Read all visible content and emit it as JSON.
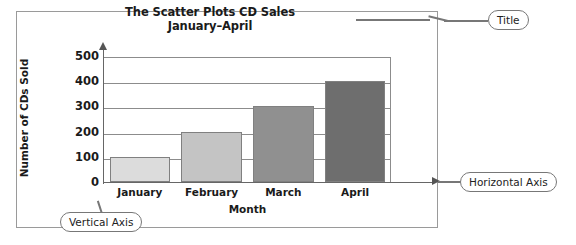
{
  "figure": {
    "frame_border_color": "#9a9a9a",
    "background": "#ffffff"
  },
  "chart_data": {
    "type": "bar",
    "title": "The Scatter Plots CD Sales",
    "subtitle": "January–April",
    "categories": [
      "January",
      "February",
      "March",
      "April"
    ],
    "values": [
      100,
      200,
      300,
      400
    ],
    "xlabel": "Month",
    "ylabel": "Number of CDs Sold",
    "ylim": [
      0,
      500
    ],
    "yticks": [
      0,
      100,
      200,
      300,
      400,
      500
    ],
    "ytick_labels": [
      "0",
      "100",
      "200",
      "300",
      "400",
      "500"
    ],
    "grid": true,
    "grid_orientation": "horizontal",
    "legend": null,
    "bar_colors": [
      "#dcdcdc",
      "#c4c4c4",
      "#909090",
      "#6e6e6e"
    ],
    "bar_border_color": "#808080",
    "axis_color": "#666666",
    "gridline_color": "#8c8c8c"
  },
  "annotations": {
    "title_callout": "Title",
    "horizontal_axis_callout": "Horizontal Axis",
    "vertical_axis_callout": "Vertical Axis"
  }
}
